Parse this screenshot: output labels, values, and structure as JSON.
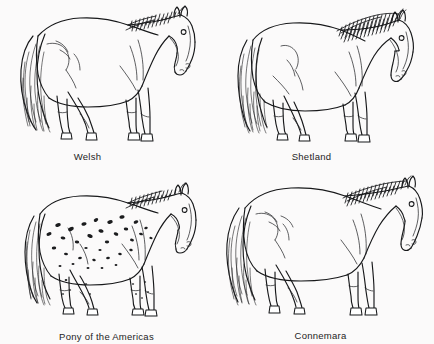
{
  "plate": {
    "title": "Pony Breeds",
    "background_color": "#fbfafa",
    "ink_color": "#17181a",
    "layout": "2x2 grid of line-drawn pony breed illustrations with captions below each"
  },
  "breeds": [
    {
      "id": "welsh",
      "label": "Welsh",
      "caption_position": "below-left-of-center",
      "figure_name": "welsh-pony-drawing",
      "description": "Side view line drawing of a Welsh pony facing right, long flowing tail at left, striped mane along neck"
    },
    {
      "id": "shetland",
      "label": "Shetland",
      "caption_position": "below-center",
      "figure_name": "shetland-pony-drawing",
      "description": "Side view line drawing of a stocky Shetland pony facing right with very thick heavy mane and thick full tail"
    },
    {
      "id": "pony-of-the-americas",
      "label": "Pony of the Americas",
      "caption_position": "below-center",
      "figure_name": "pony-of-the-americas-drawing",
      "description": "Side view line drawing of a spotted Appaloosa-patterned pony facing right with dark spots across the body"
    },
    {
      "id": "connemara",
      "label": "Connemara",
      "caption_position": "below-center",
      "figure_name": "connemara-pony-drawing",
      "description": "Side view line drawing of a Connemara pony facing right with striped mane and long tail"
    }
  ]
}
